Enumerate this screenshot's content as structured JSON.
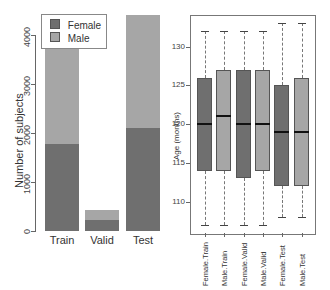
{
  "chart_data": [
    {
      "type": "bar",
      "stacked": true,
      "title": "",
      "xlabel": "",
      "ylabel": "Number of subjects",
      "ylim": [
        0,
        4400
      ],
      "yticks": [
        0,
        1000,
        2000,
        3000,
        4000
      ],
      "categories": [
        "Train",
        "Valid",
        "Test"
      ],
      "series": [
        {
          "name": "Female",
          "color": "#6f6f6f",
          "values": [
            1780,
            225,
            2100
          ]
        },
        {
          "name": "Male",
          "color": "#a6a6a6",
          "values": [
            1935,
            205,
            2310
          ]
        }
      ],
      "totals": [
        3715,
        430,
        4410
      ],
      "legend": {
        "position": "top-left",
        "entries": [
          "Female",
          "Male"
        ]
      },
      "grid": false
    },
    {
      "type": "box",
      "title": "",
      "xlabel": "",
      "ylabel": "Age (months)",
      "ylim": [
        106,
        134
      ],
      "yticks": [
        110,
        115,
        120,
        125,
        130
      ],
      "categories": [
        "Female.Train",
        "Male.Train",
        "Female.Valid",
        "Male.Valid",
        "Female.Test",
        "Male.Test"
      ],
      "series": [
        {
          "name": "Female.Train",
          "color": "#6f6f6f",
          "whisker_low": 107,
          "q1": 114,
          "median": 120,
          "q3": 126,
          "whisker_high": 132
        },
        {
          "name": "Male.Train",
          "color": "#a6a6a6",
          "whisker_low": 107,
          "q1": 114,
          "median": 121,
          "q3": 127,
          "whisker_high": 132
        },
        {
          "name": "Female.Valid",
          "color": "#6f6f6f",
          "whisker_low": 107,
          "q1": 113,
          "median": 120,
          "q3": 127,
          "whisker_high": 132
        },
        {
          "name": "Male.Valid",
          "color": "#a6a6a6",
          "whisker_low": 107,
          "q1": 114,
          "median": 120,
          "q3": 127,
          "whisker_high": 132
        },
        {
          "name": "Female.Test",
          "color": "#6f6f6f",
          "whisker_low": 108,
          "q1": 112,
          "median": 119,
          "q3": 125,
          "whisker_high": 133
        },
        {
          "name": "Male.Test",
          "color": "#a6a6a6",
          "whisker_low": 108,
          "q1": 112,
          "median": 119,
          "q3": 126,
          "whisker_high": 133
        }
      ],
      "grid": false
    }
  ],
  "left": {
    "ylabel": "Number of subjects",
    "ticks": [
      "0",
      "1000",
      "2000",
      "3000",
      "4000"
    ],
    "categories": [
      "Train",
      "Valid",
      "Test"
    ],
    "legend": [
      "Female",
      "Male"
    ]
  },
  "right": {
    "ylabel": "Age (months)",
    "ticks": [
      "110",
      "115",
      "120",
      "125",
      "130"
    ],
    "categories": [
      "Female.Train",
      "Male.Train",
      "Female.Valid",
      "Male.Valid",
      "Female.Test",
      "Male.Test"
    ]
  }
}
